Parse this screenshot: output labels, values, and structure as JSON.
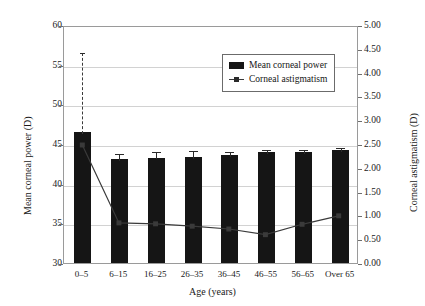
{
  "chart_data": {
    "type": "bar",
    "title": "",
    "xlabel": "Age (years)",
    "ylabel": "Mean corneal power (D)",
    "y2label": "Corneal astigmatism (D)",
    "categories": [
      "0–5",
      "6–15",
      "16–25",
      "26–35",
      "36–45",
      "46–55",
      "56–65",
      "Over 65"
    ],
    "ylim": [
      30,
      60
    ],
    "yticks": [
      30,
      35,
      40,
      45,
      50,
      55,
      60
    ],
    "ytick_labels": [
      "30",
      "35",
      "40",
      "45",
      "50",
      "55",
      "60"
    ],
    "y2lim": [
      0.0,
      5.0
    ],
    "y2ticks": [
      0.0,
      0.5,
      1.0,
      1.5,
      2.0,
      2.5,
      3.0,
      3.5,
      4.0,
      4.5,
      5.0
    ],
    "y2tick_labels": [
      "0.00",
      "0.50",
      "1.00",
      "1.50",
      "2.00",
      "2.50",
      "3.00",
      "3.50",
      "4.00",
      "4.50",
      "5.00"
    ],
    "grid": true,
    "legend_position": "upper right",
    "series": [
      {
        "name": "Mean corneal power",
        "type": "bar",
        "axis": "left",
        "color": "#151515",
        "values": [
          46.5,
          43.1,
          43.3,
          43.4,
          43.6,
          44.0,
          44.0,
          44.3
        ],
        "errors_upper": [
          10.2,
          0.9,
          0.9,
          1.0,
          0.7,
          0.5,
          0.5,
          0.4
        ]
      },
      {
        "name": "Corneal astigmatism",
        "type": "line",
        "axis": "right",
        "color": "#3a3a3a",
        "values": [
          2.5,
          0.85,
          0.83,
          0.78,
          0.72,
          0.6,
          0.82,
          1.0
        ]
      }
    ]
  },
  "legend": {
    "items": [
      {
        "label": "Mean corneal power",
        "marker": "bar-swatch"
      },
      {
        "label": "Corneal astigmatism",
        "marker": "line-marker-swatch"
      }
    ]
  }
}
